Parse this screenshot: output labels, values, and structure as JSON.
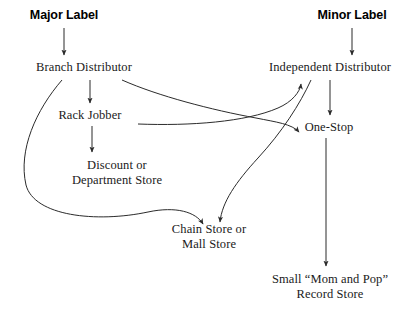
{
  "diagram": {
    "background_color": "#ffffff",
    "line_color": "#2b2b2b",
    "text_color": "#1a1a1a",
    "nodes": {
      "major_label": {
        "label": "Major Label",
        "style": "bold-sans"
      },
      "minor_label": {
        "label": "Minor Label",
        "style": "bold-sans"
      },
      "branch_distributor": {
        "label": "Branch Distributor",
        "style": "serif"
      },
      "independent_distributor": {
        "label": "Independent Distributor",
        "style": "serif"
      },
      "rack_jobber": {
        "label": "Rack Jobber",
        "style": "serif"
      },
      "one_stop": {
        "label": "One-Stop",
        "style": "serif"
      },
      "discount_store": {
        "line1": "Discount or",
        "line2": "Department Store",
        "style": "serif"
      },
      "chain_store": {
        "line1": "Chain Store or",
        "line2": "Mall Store",
        "style": "serif"
      },
      "small_store": {
        "line1": "Small “Mom and Pop”",
        "line2": "Record Store",
        "style": "serif"
      }
    },
    "edges": [
      {
        "from": "major_label",
        "to": "branch_distributor",
        "kind": "straight-down-arrow"
      },
      {
        "from": "minor_label",
        "to": "independent_distributor",
        "kind": "straight-down-arrow"
      },
      {
        "from": "branch_distributor",
        "to": "rack_jobber",
        "kind": "straight-down-arrow"
      },
      {
        "from": "branch_distributor",
        "to": "chain_store",
        "kind": "long-left-sweep-arrow"
      },
      {
        "from": "branch_distributor",
        "to": "one_stop",
        "kind": "right-curve-arrow"
      },
      {
        "from": "rack_jobber",
        "to": "discount_store",
        "kind": "straight-down-arrow"
      },
      {
        "from": "rack_jobber",
        "to": "independent_distributor",
        "kind": "flat-right-curve-arrow"
      },
      {
        "from": "independent_distributor",
        "to": "one_stop",
        "kind": "straight-down-arrow"
      },
      {
        "from": "independent_distributor",
        "to": "chain_store",
        "kind": "down-left-curve-arrow"
      },
      {
        "from": "one_stop",
        "to": "small_store",
        "kind": "long-straight-down-arrow"
      }
    ]
  }
}
